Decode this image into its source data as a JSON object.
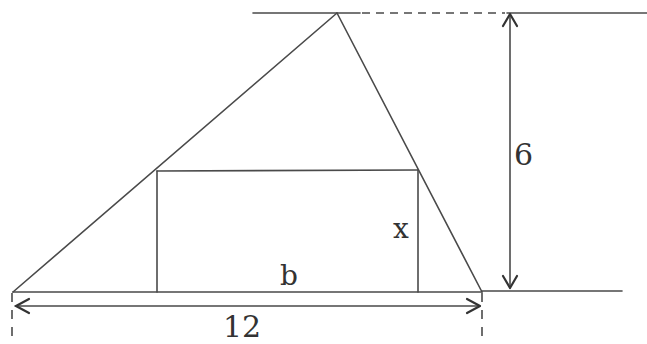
{
  "diagram": {
    "type": "geometry",
    "labels": {
      "height": "6",
      "rect_height": "x",
      "rect_base": "b",
      "triangle_base": "12"
    },
    "shapes": {
      "triangle": {
        "apex": [
          337,
          13
        ],
        "base_left": [
          13,
          292
        ],
        "base_right": [
          482,
          292
        ]
      },
      "rectangle": {
        "left": 157,
        "right": 418,
        "top": 171,
        "bottom": 292
      }
    },
    "colors": {
      "stroke": "#4a4a4a",
      "text": "#333333",
      "background": "#ffffff"
    }
  }
}
